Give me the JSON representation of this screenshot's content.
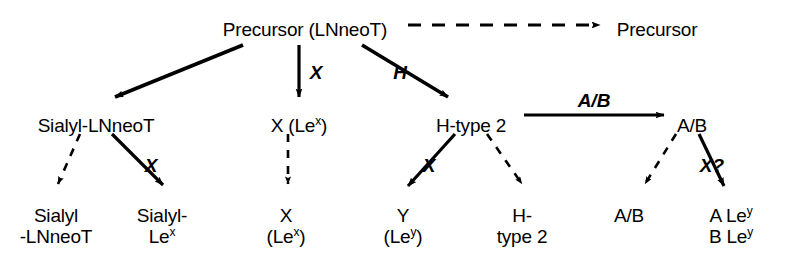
{
  "diagram": {
    "type": "biosynthetic-pathway",
    "title": "",
    "nodes": [
      {
        "id": "precursor-lnneot",
        "lines": [
          "Precursor (LNneoT)"
        ],
        "x": 305,
        "y": 19,
        "row": "top"
      },
      {
        "id": "precursor-right",
        "lines": [
          "Precursor"
        ],
        "x": 657,
        "y": 19,
        "row": "top"
      },
      {
        "id": "sialyl-lnneot",
        "lines": [
          "Sialyl-LNneoT"
        ],
        "x": 96,
        "y": 115,
        "row": "middle"
      },
      {
        "id": "x-lex",
        "lines": [
          "X (Le",
          "x",
          ")"
        ],
        "x": 299,
        "y": 115,
        "row": "middle",
        "sup": "x",
        "pre": "X (Le",
        "post": ")"
      },
      {
        "id": "h-type-2",
        "lines": [
          "H-type 2"
        ],
        "x": 471,
        "y": 115,
        "row": "middle"
      },
      {
        "id": "ab-middle",
        "lines": [
          "A/B"
        ],
        "x": 692,
        "y": 115,
        "row": "middle"
      },
      {
        "id": "sialyl-lnneot-bottom",
        "lines": [
          "Sialyl",
          "-LNneoT"
        ],
        "x": 56,
        "y": 205,
        "row": "bottom"
      },
      {
        "id": "sialyl-lex-bottom",
        "lines": [
          "Sialyl-",
          "Le",
          "x"
        ],
        "x": 162,
        "y": 205,
        "row": "bottom"
      },
      {
        "id": "x-lex-bottom",
        "lines": [
          "X",
          "(Le",
          "x",
          ")"
        ],
        "x": 286,
        "y": 205,
        "row": "bottom"
      },
      {
        "id": "y-ley-bottom",
        "lines": [
          "Y",
          "(Le",
          "y",
          ")"
        ],
        "x": 403,
        "y": 205,
        "row": "bottom"
      },
      {
        "id": "h-type-2-bottom",
        "lines": [
          "H-",
          "type 2"
        ],
        "x": 522,
        "y": 205,
        "row": "bottom"
      },
      {
        "id": "ab-bottom",
        "lines": [
          "A/B"
        ],
        "x": 629,
        "y": 205,
        "row": "bottom"
      },
      {
        "id": "a-b-ley-bottom",
        "lines": [
          "A Le",
          "y",
          "B Le",
          "y"
        ],
        "x": 731,
        "y": 205,
        "row": "bottom"
      }
    ],
    "node_text": {
      "precursor_lnneot": "Precursor (LNneoT)",
      "precursor_right": "Precursor",
      "sialyl_lnneot": "Sialyl-LNneoT",
      "x_lex_pre": "X (Le",
      "x_lex_sup": "x",
      "x_lex_post": ")",
      "h_type_2": "H-type 2",
      "ab_middle": "A/B",
      "b_sialyl_line1": "Sialyl",
      "b_sialyl_line2": "-LNneoT",
      "b_sialyl_lex_line1": "Sialyl-",
      "b_sialyl_lex_line2": "Le",
      "b_sialyl_lex_sup": "x",
      "b_x_line1": "X",
      "b_x_line2_pre": "(Le",
      "b_x_sup": "x",
      "b_x_line2_post": ")",
      "b_y_line1": "Y",
      "b_y_line2_pre": "(Le",
      "b_y_sup": "y",
      "b_y_line2_post": ")",
      "b_h_line1": "H-",
      "b_h_line2": "type 2",
      "b_ab": "A/B",
      "b_aley_pre": "A Le",
      "b_aley_sup": "y",
      "b_bley_pre": "B Le",
      "b_bley_sup": "y"
    },
    "enzyme_labels": [
      {
        "id": "enz-x-top",
        "label": "X",
        "x": 316,
        "y": 62
      },
      {
        "id": "enz-h-top",
        "label": "H",
        "x": 400,
        "y": 62
      },
      {
        "id": "enz-x-sialyl",
        "label": "X",
        "x": 151,
        "y": 155
      },
      {
        "id": "enz-x-htype2",
        "label": "X",
        "x": 429,
        "y": 155
      },
      {
        "id": "enz-ab-horizontal",
        "label": "A/B",
        "x": 594,
        "y": 90
      },
      {
        "id": "enz-x-question",
        "label": "X?",
        "x": 710,
        "y": 155
      }
    ],
    "enzyme_text": {
      "x_top": "X",
      "h_top": "H",
      "x_sialyl": "X",
      "x_htype2": "X",
      "ab_horizontal": "A/B",
      "x_question": "X?"
    },
    "edges": [
      {
        "id": "edge-precursor-to-precursor",
        "from": "precursor-lnneot",
        "to": "precursor-right",
        "style": "dashed",
        "label": ""
      },
      {
        "id": "edge-precursor-to-sialyl",
        "from": "precursor-lnneot",
        "to": "sialyl-lnneot",
        "style": "solid",
        "label": ""
      },
      {
        "id": "edge-precursor-to-x",
        "from": "precursor-lnneot",
        "to": "x-lex",
        "style": "solid",
        "label": "X"
      },
      {
        "id": "edge-precursor-to-htype2",
        "from": "precursor-lnneot",
        "to": "h-type-2",
        "style": "solid",
        "label": "H"
      },
      {
        "id": "edge-htype2-to-ab",
        "from": "h-type-2",
        "to": "ab-middle",
        "style": "solid",
        "label": "A/B"
      },
      {
        "id": "edge-sialyl-to-sialyl-lnneot",
        "from": "sialyl-lnneot",
        "to": "sialyl-lnneot-bottom",
        "style": "dashed",
        "label": ""
      },
      {
        "id": "edge-sialyl-to-sialyl-lex",
        "from": "sialyl-lnneot",
        "to": "sialyl-lex-bottom",
        "style": "solid",
        "label": "X"
      },
      {
        "id": "edge-x-to-x-bottom",
        "from": "x-lex",
        "to": "x-lex-bottom",
        "style": "dashed",
        "label": ""
      },
      {
        "id": "edge-htype2-to-y",
        "from": "h-type-2",
        "to": "y-ley-bottom",
        "style": "solid",
        "label": "X"
      },
      {
        "id": "edge-htype2-to-htype2-bottom",
        "from": "h-type-2",
        "to": "h-type-2-bottom",
        "style": "dashed",
        "label": ""
      },
      {
        "id": "edge-ab-to-ab-bottom",
        "from": "ab-middle",
        "to": "ab-bottom",
        "style": "dashed",
        "label": ""
      },
      {
        "id": "edge-ab-to-aley",
        "from": "ab-middle",
        "to": "a-b-ley-bottom",
        "style": "solid",
        "label": "X?"
      }
    ],
    "colors": {
      "ink": "#000000",
      "background": "#ffffff"
    }
  }
}
